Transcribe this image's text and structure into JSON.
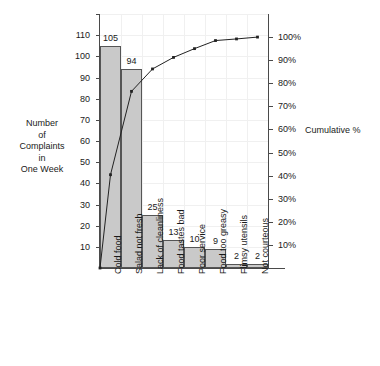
{
  "chart_data": {
    "type": "bar",
    "title": "",
    "subtitle": "",
    "xlabel": "",
    "ylabel": "Number of Complaints in One Week",
    "y2label": "Cumulative %",
    "ylim": [
      0,
      120
    ],
    "y2lim": [
      0,
      110
    ],
    "grid": true,
    "legend": "none",
    "categories": [
      "Cold food",
      "Salad not fresh",
      "Lack of cleanliness",
      "Food tastes bad",
      "Poor service",
      "Food too greasy",
      "Flimsy utensils",
      "Not courteous"
    ],
    "values": [
      105,
      94,
      25,
      13,
      10,
      9,
      2,
      2
    ],
    "data_labels": [
      "105",
      "94",
      "25",
      "13",
      "10",
      "9",
      "2",
      "2"
    ],
    "total": 260,
    "series": [
      {
        "name": "Complaints",
        "type": "bar",
        "values": [
          105,
          94,
          25,
          13,
          10,
          9,
          2,
          2
        ]
      },
      {
        "name": "Cumulative %",
        "type": "line",
        "axis": "right",
        "values": [
          40.4,
          76.5,
          86.2,
          91.2,
          95.0,
          98.5,
          99.2,
          100.0
        ],
        "start_at_origin": true
      }
    ],
    "y_ticks": [
      10,
      20,
      30,
      40,
      50,
      60,
      70,
      80,
      90,
      100,
      110
    ],
    "y_tick_labels": [
      "10",
      "20",
      "30",
      "40",
      "50",
      "60",
      "70",
      "80",
      "90",
      "100",
      "110"
    ],
    "y2_ticks": [
      10,
      20,
      30,
      40,
      50,
      60,
      70,
      80,
      90,
      100
    ],
    "y2_tick_labels": [
      "10%",
      "20%",
      "30%",
      "40%",
      "50%",
      "60%",
      "70%",
      "80%",
      "90%",
      "100%"
    ],
    "colors": {
      "bar_fill": "#c9c9c9",
      "bar_stroke": "#555555",
      "line": "#222222",
      "axis": "#4a4a4a",
      "grid": "#f0f0f0",
      "text": "#1a1a1a",
      "background": "#ffffff"
    }
  },
  "axis_titles": {
    "left_line1": "Number",
    "left_line2": "of",
    "left_line3": "Complaints",
    "left_line4": "in",
    "left_line5": "One Week",
    "right": "Cumulative %"
  }
}
